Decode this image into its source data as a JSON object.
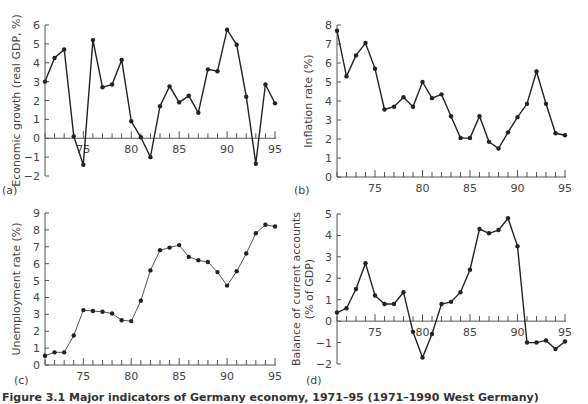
{
  "caption": "Figure 3.1 Major indicators of Germany economy, 1971–95 (1971–1990 West Germany)",
  "chart_data": [
    {
      "type": "line",
      "panel": "(a)",
      "title": "",
      "xlabel": "",
      "ylabel": "Economic growth (real GDP, %)",
      "x": [
        71,
        72,
        73,
        74,
        75,
        76,
        77,
        78,
        79,
        80,
        81,
        82,
        83,
        84,
        85,
        86,
        87,
        88,
        89,
        90,
        91,
        92,
        93,
        94,
        95
      ],
      "values": [
        3.0,
        4.25,
        4.7,
        0.1,
        -1.4,
        5.2,
        2.7,
        2.85,
        4.15,
        0.9,
        0.05,
        -1.0,
        1.7,
        2.75,
        1.9,
        2.25,
        1.35,
        3.65,
        3.55,
        5.75,
        4.95,
        2.2,
        -1.35,
        2.85,
        1.85
      ],
      "ylim": [
        -2,
        6
      ],
      "yticks": [
        -2,
        -1,
        0,
        1,
        2,
        3,
        4,
        5,
        6
      ],
      "xlim": [
        71,
        95
      ],
      "xtick_labels": [
        "75",
        "80",
        "85",
        "90",
        "95"
      ],
      "grid": false
    },
    {
      "type": "line",
      "panel": "(b)",
      "title": "",
      "xlabel": "",
      "ylabel": "Inflation rate (%)",
      "x": [
        71,
        72,
        73,
        74,
        75,
        76,
        77,
        78,
        79,
        80,
        81,
        82,
        83,
        84,
        85,
        86,
        87,
        88,
        89,
        90,
        91,
        92,
        93,
        94,
        95
      ],
      "values": [
        7.7,
        5.3,
        6.4,
        7.05,
        5.7,
        3.55,
        3.7,
        4.2,
        3.7,
        5.0,
        4.15,
        4.35,
        3.2,
        2.05,
        2.05,
        3.2,
        1.85,
        1.5,
        2.35,
        3.15,
        3.85,
        5.55,
        3.85,
        2.3,
        2.2
      ],
      "ylim": [
        0,
        8
      ],
      "yticks": [
        0,
        1,
        2,
        3,
        4,
        5,
        6,
        7,
        8
      ],
      "xlim": [
        71,
        95
      ],
      "xtick_labels": [
        "75",
        "80",
        "85",
        "90",
        "95"
      ],
      "grid": false
    },
    {
      "type": "line",
      "panel": "(c)",
      "title": "",
      "xlabel": "",
      "ylabel": "Unemployment rate (%)",
      "x": [
        71,
        72,
        73,
        74,
        75,
        76,
        77,
        78,
        79,
        80,
        81,
        82,
        83,
        84,
        85,
        86,
        87,
        88,
        89,
        90,
        91,
        92,
        93,
        94,
        95
      ],
      "values": [
        0.55,
        0.75,
        0.75,
        1.75,
        3.25,
        3.2,
        3.15,
        3.05,
        2.65,
        2.6,
        3.8,
        5.6,
        6.8,
        6.95,
        7.1,
        6.4,
        6.2,
        6.1,
        5.5,
        4.7,
        5.55,
        6.6,
        7.8,
        8.3,
        8.2
      ],
      "ylim": [
        0,
        9
      ],
      "yticks": [
        0,
        1,
        2,
        3,
        4,
        5,
        6,
        7,
        8,
        9
      ],
      "xlim": [
        71,
        95
      ],
      "xtick_labels": [
        "75",
        "80",
        "85",
        "90",
        "95"
      ],
      "grid": false
    },
    {
      "type": "line",
      "panel": "(d)",
      "title": "",
      "xlabel": "",
      "ylabel": "Balance of current accounts (% of GDP)",
      "ylabel_lines": [
        "Balance of current accounts",
        "(% of GDP)"
      ],
      "x": [
        71,
        72,
        73,
        74,
        75,
        76,
        77,
        78,
        79,
        80,
        81,
        82,
        83,
        84,
        85,
        86,
        87,
        88,
        89,
        90,
        91,
        92,
        93,
        94,
        95
      ],
      "values": [
        0.4,
        0.6,
        1.5,
        2.7,
        1.2,
        0.8,
        0.8,
        1.35,
        -0.5,
        -1.7,
        -0.6,
        0.8,
        0.9,
        1.35,
        2.4,
        4.3,
        4.1,
        4.25,
        4.8,
        3.5,
        -1.0,
        -1.0,
        -0.9,
        -1.3,
        -0.95
      ],
      "ylim": [
        -2,
        5
      ],
      "yticks": [
        -2,
        -1,
        0,
        1,
        2,
        3,
        4,
        5
      ],
      "xlim": [
        71,
        95
      ],
      "xtick_labels": [
        "75",
        "80",
        "85",
        "90",
        "95"
      ],
      "grid": false
    }
  ]
}
